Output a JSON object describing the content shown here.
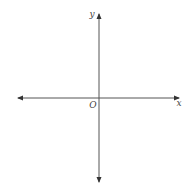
{
  "diagram": {
    "type": "coordinate-axes",
    "origin": {
      "label": "O",
      "x": 99,
      "y": 98
    },
    "x_axis": {
      "label": "x",
      "from": {
        "x": 17,
        "y": 98
      },
      "to": {
        "x": 180,
        "y": 98
      },
      "arrows": [
        "left",
        "right"
      ]
    },
    "y_axis": {
      "label": "y",
      "from": {
        "x": 99,
        "y": 183
      },
      "to": {
        "x": 99,
        "y": 13
      },
      "arrows": [
        "up",
        "down"
      ]
    },
    "colors": {
      "axis": "#555555",
      "arrowhead": "#333333",
      "label": "#444444",
      "background": "#ffffff"
    }
  }
}
